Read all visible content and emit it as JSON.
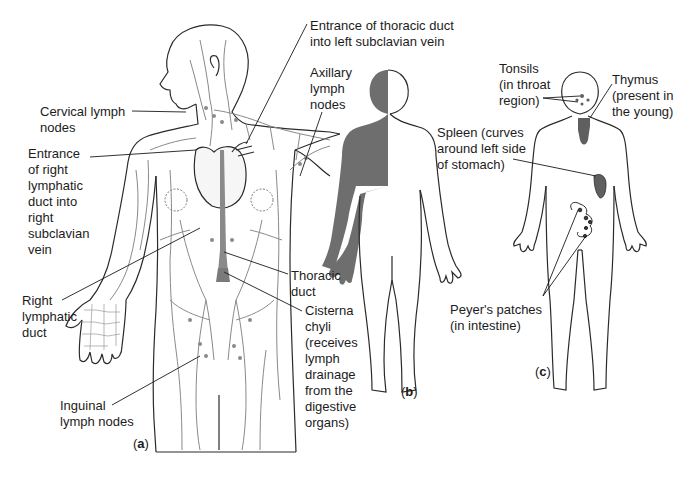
{
  "figure": {
    "panels": [
      {
        "id": "a",
        "label": "(a)",
        "description": "Lymphatic vessels and nodes of the body"
      },
      {
        "id": "b",
        "label": "(b)",
        "description": "Regions drained by right lymphatic duct (shaded) vs thoracic duct"
      },
      {
        "id": "c",
        "label": "(c)",
        "description": "Other lymphoid organs"
      }
    ],
    "colors": {
      "vessel": "#8a8a8a",
      "shade": "#6e6e6e",
      "organ": "#5f5f5f",
      "outline": "#2a2a2a",
      "leader": "#1a1a1a"
    }
  },
  "labels": {
    "entrance_thoracic": "Entrance of thoracic duct\ninto left subclavian vein",
    "axillary": "Axillary\nlymph\nnodes",
    "cervical": "Cervical lymph\nnodes",
    "entrance_right": "Entrance\nof right\nlymphatic\nduct into\nright\nsubclavian\nvein",
    "right_lymphatic_duct": "Right\nlymphatic\nduct",
    "thoracic_duct": "Thoracic\nduct",
    "cisterna": "Cisterna\nchyli\n(receives\nlymph\ndrainage\nfrom the\ndigestive\norgans)",
    "inguinal": "Inguinal\nlymph nodes",
    "tonsils": "Tonsils\n(in throat\nregion)",
    "thymus": "Thymus\n(present in\nthe young)",
    "spleen": "Spleen (curves\naround left side\nof stomach)",
    "peyers": "Peyer's patches\n(in intestine)"
  },
  "panel_labels": {
    "a_open": "(",
    "a": "a",
    "a_close": ")",
    "b_open": "(",
    "b": "b",
    "b_close": ")",
    "c_open": "(",
    "c": "c",
    "c_close": ")"
  }
}
